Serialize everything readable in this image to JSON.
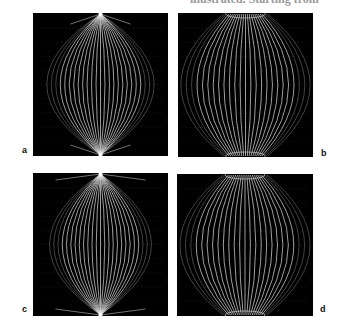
{
  "header": {
    "clipped_text": "illustrated. Starting from"
  },
  "figure": {
    "panels": [
      {
        "id": "a",
        "label": "a",
        "style": "pointed"
      },
      {
        "id": "b",
        "label": "b",
        "style": "flattened"
      },
      {
        "id": "c",
        "label": "c",
        "style": "pointed-wide"
      },
      {
        "id": "d",
        "label": "d",
        "style": "flattened"
      }
    ],
    "colors": {
      "background": "#000000",
      "lines": "#e8e8e8",
      "page": "#ffffff"
    }
  }
}
